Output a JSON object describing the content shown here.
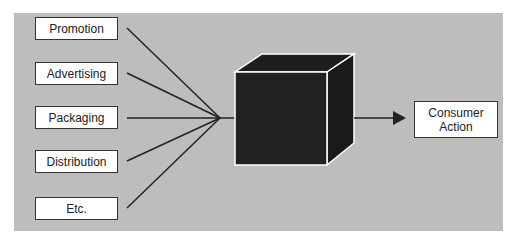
{
  "diagram": {
    "inputs": [
      {
        "label": "Promotion"
      },
      {
        "label": "Advertising"
      },
      {
        "label": "Packaging"
      },
      {
        "label": "Distribution"
      },
      {
        "label": "Etc."
      }
    ],
    "center": {
      "label": "black-box",
      "description": "Black box (consumer mind)"
    },
    "output": {
      "line1": "Consumer",
      "line2": "Action"
    }
  },
  "colors": {
    "panel": "#bdbdbd",
    "cube": "#1e1e1e",
    "box_fill": "#ffffff",
    "line": "#222222"
  }
}
